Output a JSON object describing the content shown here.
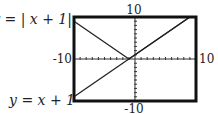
{
  "chart_data": {
    "type": "line",
    "title": "",
    "xlabel": "",
    "ylabel": "",
    "xlim": [
      -10,
      10
    ],
    "ylim": [
      -10,
      10
    ],
    "grid": false,
    "tick_labels": {
      "x_min": "-10",
      "x_max": "10",
      "y_min": "-10",
      "y_max": "10"
    },
    "tick_step": 1,
    "series": [
      {
        "name": "y = |x + 1|",
        "label": "y = | x + 1|",
        "function": "abs(x+1)",
        "x": [
          -10,
          -1,
          9
        ],
        "y": [
          9,
          0,
          10
        ]
      },
      {
        "name": "y = x + 1",
        "label": "y = x + 1",
        "function": "x+1",
        "x": [
          -10,
          9
        ],
        "y": [
          -9,
          10
        ]
      }
    ],
    "colors": {
      "line": "#222222",
      "frame": "#111111",
      "axis": "#333333"
    }
  }
}
